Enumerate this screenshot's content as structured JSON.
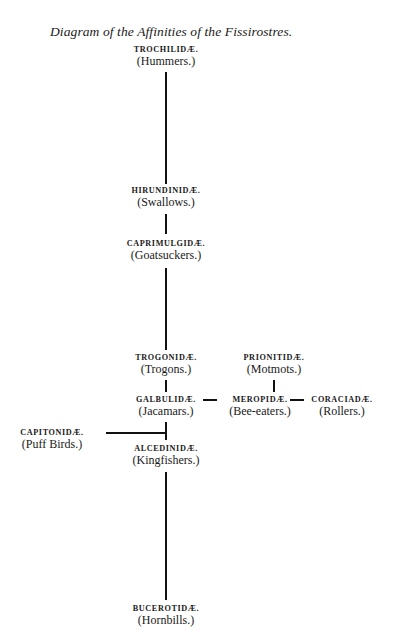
{
  "diagram": {
    "title": "Diagram of the Affinities of the Fissirostres.",
    "nodes": [
      {
        "id": "trochilidae",
        "family": "TROCHILIDÆ.",
        "common": "(Hummers.)"
      },
      {
        "id": "hirundinidae",
        "family": "HIRUNDINIDÆ.",
        "common": "(Swallows.)"
      },
      {
        "id": "caprimulgidae",
        "family": "CAPRIMULGIDÆ.",
        "common": "(Goatsuckers.)"
      },
      {
        "id": "trogonidae",
        "family": "TROGONIDÆ.",
        "common": "(Trogons.)"
      },
      {
        "id": "prionitidae",
        "family": "PRIONITIDÆ.",
        "common": "(Motmots.)"
      },
      {
        "id": "galbulidae",
        "family": "GALBULIDÆ.",
        "common": "(Jacamars.)"
      },
      {
        "id": "meropidae",
        "family": "MEROPIDÆ.",
        "common": "(Bee-eaters.)"
      },
      {
        "id": "coraciadae",
        "family": "CORACIADÆ.",
        "common": "(Rollers.)"
      },
      {
        "id": "capitonidae",
        "family": "CAPITONIDÆ.",
        "common": "(Puff Birds.)"
      },
      {
        "id": "alcedinidae",
        "family": "ALCEDINIDÆ.",
        "common": "(Kingfishers.)"
      },
      {
        "id": "bucerotidae",
        "family": "BUCEROTIDÆ.",
        "common": "(Hornbills.)"
      }
    ],
    "edges": [
      {
        "from": "trochilidae",
        "to": "hirundinidae"
      },
      {
        "from": "hirundinidae",
        "to": "caprimulgidae"
      },
      {
        "from": "caprimulgidae",
        "to": "trogonidae"
      },
      {
        "from": "trogonidae",
        "to": "galbulidae"
      },
      {
        "from": "galbulidae",
        "to": "meropidae"
      },
      {
        "from": "meropidae",
        "to": "coraciadae"
      },
      {
        "from": "prionitidae",
        "to": "meropidae"
      },
      {
        "from": "galbulidae",
        "to": "alcedinidae"
      },
      {
        "from": "capitonidae",
        "to": "alcedinidae"
      },
      {
        "from": "alcedinidae",
        "to": "bucerotidae"
      }
    ]
  }
}
